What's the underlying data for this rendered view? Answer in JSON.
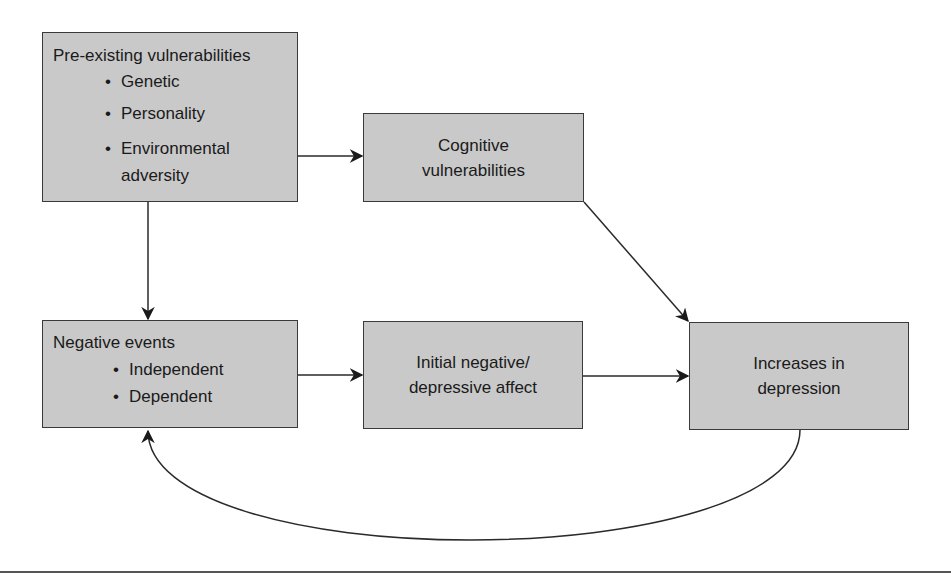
{
  "diagram": {
    "nodes": {
      "preexisting": {
        "title": "Pre-existing vulnerabilities",
        "items": [
          "Genetic",
          "Personality",
          "Environmental adversity"
        ],
        "items_display": [
          "Genetic",
          "Personality",
          "Environmental",
          "adversity"
        ]
      },
      "cognitive": {
        "line1": "Cognitive",
        "line2": "vulnerabilities"
      },
      "negative_events": {
        "title": "Negative events",
        "items": [
          "Independent",
          "Dependent"
        ]
      },
      "initial_affect": {
        "line1": "Initial negative/",
        "line2": "depressive affect"
      },
      "increases": {
        "line1": "Increases in",
        "line2": "depression"
      }
    },
    "bullet": "•",
    "edges": [
      {
        "from": "Pre-existing vulnerabilities",
        "to": "Cognitive vulnerabilities"
      },
      {
        "from": "Pre-existing vulnerabilities",
        "to": "Negative events"
      },
      {
        "from": "Cognitive vulnerabilities",
        "to": "Increases in depression"
      },
      {
        "from": "Negative events",
        "to": "Initial negative/depressive affect"
      },
      {
        "from": "Initial negative/depressive affect",
        "to": "Increases in depression"
      },
      {
        "from": "Increases in depression",
        "to": "Negative events",
        "style": "curved feedback"
      }
    ],
    "colors": {
      "box_fill": "#c9c9c9",
      "stroke": "#2a2a2a"
    }
  }
}
